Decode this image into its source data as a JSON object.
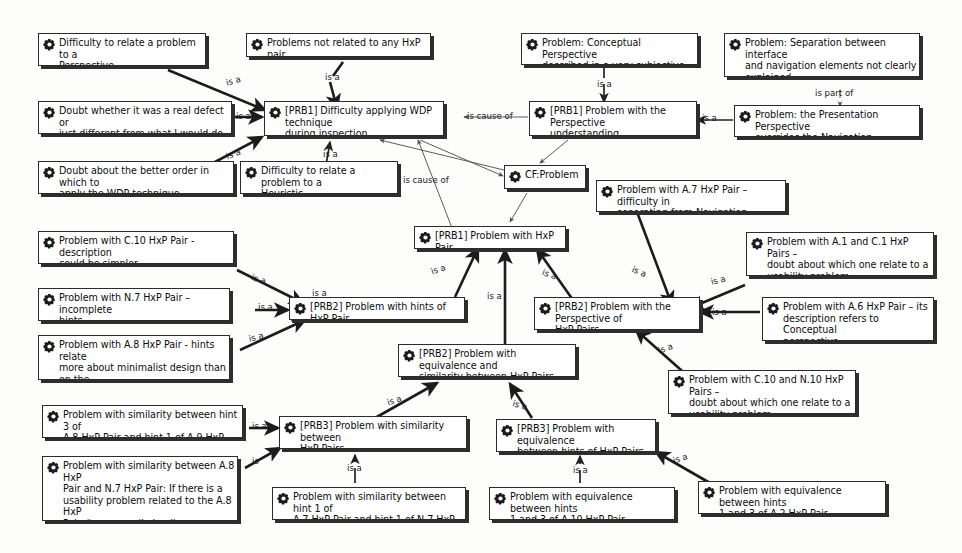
{
  "diagram": {
    "icon_name": "cog-icon",
    "relation_is_a": "is a",
    "relation_is_cause_of": "is cause of",
    "relation_is_part_of": "is part of",
    "colors": {
      "node_fill": "#ffffff",
      "node_border": "#2b2b2b",
      "node_shadow": "#2e2e2e",
      "edge_strong": "#1c1c1c",
      "edge_light": "#4a4a4a",
      "text": "#0d0d0d",
      "background": "#fdfdfc"
    }
  },
  "nodes": [
    {
      "id": "n1",
      "label": "Difficulty to relate a problem to a\nPerspective"
    },
    {
      "id": "n2",
      "label": "Problems not related to any HxP pair"
    },
    {
      "id": "n3",
      "label": "Problem: Conceptual Perspective\ndescribed in a very subjective way"
    },
    {
      "id": "n4",
      "label": "Problem: Separation between interface\nand navigation elements not clearly\nexplained"
    },
    {
      "id": "n5",
      "label": "Doubt whether it was a real defect or\njust different from what I would do"
    },
    {
      "id": "n6",
      "label": "[PRB1] Difficulty applying WDP technique\nduring inspection"
    },
    {
      "id": "n7",
      "label": "[PRB1] Problem with the Perspective\nunderstanding"
    },
    {
      "id": "n8",
      "label": "Problem: the Presentation Perspective\noverrides the Navigation Perspective"
    },
    {
      "id": "n9",
      "label": "Doubt about the better order in which to\napply the WDP technique"
    },
    {
      "id": "n10",
      "label": "Difficulty to relate a problem to a\nHeuristic"
    },
    {
      "id": "n11",
      "label": "CF:Problem"
    },
    {
      "id": "n12",
      "label": "Problem with A.7 HxP Pair – difficulty in\nseparating from Navigation Perspective"
    },
    {
      "id": "n13",
      "label": "[PRB1] Problem with HxP Pair"
    },
    {
      "id": "n14",
      "label": "Problem with C.10 HxP Pair - description\ncould be simpler"
    },
    {
      "id": "n15",
      "label": "Problem with A.1 and C.1 HxP Pairs –\ndoubt about which one relate to a\nusability problem"
    },
    {
      "id": "n16",
      "label": "Problem with N.7 HxP Pair – incomplete\nhints"
    },
    {
      "id": "n17",
      "label": "[PRB2] Problem with hints of HxP Pair"
    },
    {
      "id": "n18",
      "label": "[PRB2] Problem with the Perspective of\nHxP Pairs"
    },
    {
      "id": "n19",
      "label": "Problem with A.6 HxP Pair – its\ndescription refers to Conceptual\nperspective"
    },
    {
      "id": "n20",
      "label": "Problem with A.8 HxP Pair - hints relate\nmore about minimalist design than on the\naesthetics issue"
    },
    {
      "id": "n21",
      "label": "[PRB2] Problem with equivalence and\nsimilarity between HxP Pairs"
    },
    {
      "id": "n22",
      "label": "Problem with C.10 and N.10 HxP Pairs –\ndoubt about which one relate to a\nusability problem"
    },
    {
      "id": "n23",
      "label": "Problem with similarity between hint 3 of\nA.8 HxP Pair and hint 1 of A.9 HxP Pair"
    },
    {
      "id": "n24",
      "label": "[PRB3] Problem with similarity between\nHxP Pairs"
    },
    {
      "id": "n25",
      "label": "[PRB3] Problem with equivalence\nbetween hints of HxP Pairs"
    },
    {
      "id": "n26",
      "label": "Problem with similarity between A.8 HxP\nPair and N.7 HxP Pair: If there is a\nusability problem related to the A.8 HxP\nPair, it necessarily implies a problem\nrelated to the N.7 HxP Pair"
    },
    {
      "id": "n27",
      "label": "Problem with similarity between hint 1 of\nA.7 HxP Pair and hint 1 of N.7 HxP Pair"
    },
    {
      "id": "n28",
      "label": "Problem with equivalence between hints\n1 and 3 of A.10 HxP Pair"
    },
    {
      "id": "n29",
      "label": "Problem with equivalence between hints\n1 and 3 of A.2 HxP Pair"
    }
  ],
  "edge_labels": [
    {
      "id": "e1",
      "text": "is a"
    },
    {
      "id": "e2",
      "text": "is a"
    },
    {
      "id": "e3",
      "text": "is a"
    },
    {
      "id": "e4",
      "text": "is a"
    },
    {
      "id": "e5",
      "text": "is a"
    },
    {
      "id": "e6",
      "text": "is a"
    },
    {
      "id": "e7",
      "text": "is cause of"
    },
    {
      "id": "e8",
      "text": "is part of"
    },
    {
      "id": "e9",
      "text": "is a"
    },
    {
      "id": "e10",
      "text": "is cause of"
    },
    {
      "id": "e11",
      "text": "is a"
    },
    {
      "id": "e12",
      "text": "is a"
    },
    {
      "id": "e13",
      "text": "is a"
    },
    {
      "id": "e14",
      "text": "is a"
    },
    {
      "id": "e15",
      "text": "is a"
    },
    {
      "id": "e16",
      "text": "is a"
    },
    {
      "id": "e17",
      "text": "is a"
    },
    {
      "id": "e18",
      "text": "is a"
    },
    {
      "id": "e19",
      "text": "is a"
    },
    {
      "id": "e20",
      "text": "is a"
    },
    {
      "id": "e21",
      "text": "is a"
    },
    {
      "id": "e22",
      "text": "is a"
    },
    {
      "id": "e23",
      "text": "is a"
    },
    {
      "id": "e24",
      "text": "is a"
    },
    {
      "id": "e25",
      "text": "is a"
    },
    {
      "id": "e26",
      "text": "is a"
    },
    {
      "id": "e27",
      "text": "is a"
    },
    {
      "id": "e28",
      "text": "is"
    }
  ]
}
